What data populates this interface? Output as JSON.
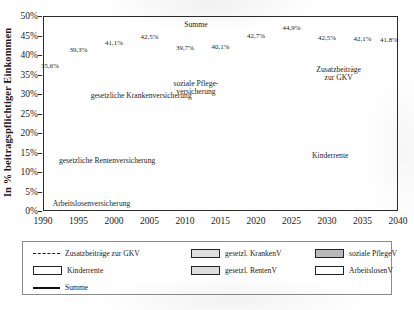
{
  "chart_data": {
    "type": "area",
    "title": "",
    "xlabel": "",
    "ylabel": "In % beitragspflichtiger Einkommen",
    "ylim": [
      0,
      50
    ],
    "xlim": [
      1990,
      2040
    ],
    "ytick_labels": [
      "0%",
      "5%",
      "10%",
      "15%",
      "20%",
      "25%",
      "30%",
      "35%",
      "40%",
      "45%",
      "50%"
    ],
    "ytick_values": [
      0,
      5,
      10,
      15,
      20,
      25,
      30,
      35,
      40,
      45,
      50
    ],
    "xtick_labels": [
      "1990",
      "1995",
      "2000",
      "2005",
      "2010",
      "2015",
      "2020",
      "2025",
      "2030",
      "2035",
      "2040"
    ],
    "xtick_values": [
      1990,
      1995,
      2000,
      2005,
      2010,
      2015,
      2020,
      2025,
      2030,
      2035,
      2040
    ],
    "grid": "horizontal",
    "legend_position": "bottom",
    "stacked": true,
    "x": [
      1990,
      1991,
      1992,
      1993,
      1994,
      1995,
      1996,
      1997,
      1998,
      1999,
      2000,
      2001,
      2002,
      2003,
      2004,
      2005,
      2006,
      2007,
      2008,
      2009,
      2010,
      2011,
      2012,
      2013,
      2014,
      2015,
      2016,
      2017,
      2018,
      2019,
      2020,
      2021,
      2022,
      2023,
      2024,
      2025,
      2026,
      2027,
      2028,
      2029,
      2030,
      2031,
      2032,
      2033,
      2034,
      2035,
      2036,
      2037,
      2038,
      2039,
      2040
    ],
    "series": [
      {
        "name": "ArbeitslosenV",
        "label": "Arbeitslosenversicherung",
        "color": "#ffffff",
        "values": [
          4.3,
          4.3,
          6.3,
          6.5,
          6.5,
          6.5,
          6.5,
          6.5,
          6.5,
          6.5,
          6.5,
          6.5,
          6.5,
          6.5,
          6.5,
          6.5,
          6.5,
          4.2,
          3.3,
          2.8,
          2.8,
          3.0,
          3.0,
          3.0,
          3.0,
          3.0,
          3.0,
          3.0,
          3.0,
          2.5,
          2.4,
          2.4,
          2.4,
          2.6,
          2.6,
          2.6,
          2.6,
          2.6,
          2.6,
          2.6,
          2.6,
          2.6,
          2.6,
          2.6,
          2.6,
          2.6,
          2.6,
          2.6,
          2.6,
          2.6,
          2.6
        ]
      },
      {
        "name": "gesetzl. RentenV",
        "label": "gesetzliche Rentenversicherung",
        "color": "#e3e3e3",
        "values": [
          18.7,
          17.7,
          17.7,
          17.5,
          19.2,
          18.6,
          19.2,
          20.3,
          20.3,
          19.5,
          19.3,
          19.1,
          19.1,
          19.5,
          19.5,
          19.5,
          19.5,
          19.9,
          19.9,
          19.9,
          19.9,
          19.6,
          19.6,
          18.9,
          18.9,
          18.7,
          18.7,
          18.7,
          18.6,
          18.6,
          18.6,
          18.6,
          18.6,
          18.6,
          18.6,
          18.8,
          19.1,
          19.4,
          19.8,
          20.1,
          20.4,
          20.6,
          20.8,
          21.0,
          21.2,
          21.4,
          21.5,
          21.7,
          21.8,
          21.9,
          22.0
        ]
      },
      {
        "name": "Kinderrente",
        "label": "Kinderrente",
        "color": "#ffffff",
        "values": [
          0.0,
          0.0,
          0.0,
          0.0,
          0.0,
          0.0,
          0.0,
          0.0,
          0.0,
          0.0,
          0.0,
          0.0,
          0.0,
          0.0,
          0.0,
          0.0,
          0.0,
          0.0,
          0.0,
          0.0,
          0.0,
          0.0,
          0.0,
          0.0,
          0.0,
          0.0,
          0.0,
          0.0,
          0.0,
          0.0,
          0.0,
          0.0,
          0.0,
          0.0,
          0.0,
          0.0,
          0.8,
          0.9,
          0.9,
          0.9,
          0.9,
          0.9,
          0.9,
          0.9,
          0.9,
          0.9,
          0.9,
          0.9,
          0.9,
          0.9,
          0.9
        ]
      },
      {
        "name": "soziale PflegeV",
        "label": "soziale Pflegeversicherung",
        "color": "#b9b9b9",
        "values": [
          0.0,
          0.0,
          0.0,
          0.0,
          0.0,
          1.0,
          1.7,
          1.7,
          1.7,
          1.7,
          1.7,
          1.7,
          1.7,
          1.7,
          1.7,
          1.7,
          1.7,
          1.7,
          1.8,
          1.95,
          1.95,
          1.95,
          1.95,
          2.05,
          2.05,
          2.35,
          2.35,
          2.55,
          2.55,
          3.05,
          3.05,
          3.05,
          3.05,
          3.4,
          3.4,
          3.5,
          3.6,
          3.7,
          3.8,
          3.9,
          4.0,
          4.1,
          4.2,
          4.3,
          4.4,
          4.5,
          4.6,
          4.7,
          4.8,
          4.9,
          5.0
        ]
      },
      {
        "name": "gesetzl. KrankenV",
        "label": "gesetzliche Krankenversicherung",
        "color": "#e8e8e8",
        "values": [
          12.6,
          13.2,
          12.7,
          13.4,
          13.2,
          13.2,
          13.6,
          13.5,
          13.5,
          13.5,
          13.6,
          13.6,
          14.0,
          14.3,
          14.2,
          13.7,
          13.3,
          13.9,
          14.0,
          14.9,
          14.9,
          15.5,
          15.5,
          15.5,
          15.5,
          15.5,
          15.7,
          15.8,
          15.9,
          16.2,
          16.3,
          16.4,
          16.5,
          16.6,
          16.7,
          16.9,
          16.2,
          15.7,
          15.4,
          15.1,
          14.9,
          14.7,
          14.5,
          14.4,
          14.3,
          14.2,
          14.1,
          14.0,
          13.9,
          13.8,
          13.7
        ]
      }
    ],
    "summe": {
      "name": "Summe",
      "label": "Summe",
      "color": "#111111",
      "values": [
        35.6,
        35.2,
        36.7,
        37.4,
        38.9,
        39.3,
        41.0,
        42.0,
        42.0,
        41.2,
        41.1,
        40.9,
        41.3,
        42.0,
        41.9,
        41.4,
        41.0,
        39.7,
        39.0,
        39.55,
        39.55,
        40.05,
        40.05,
        39.45,
        39.45,
        39.55,
        39.75,
        40.05,
        40.05,
        40.35,
        40.35,
        40.45,
        40.55,
        41.2,
        41.3,
        44.9,
        44.3,
        43.4,
        42.9,
        42.7,
        42.5,
        42.4,
        42.4,
        42.3,
        42.3,
        42.2,
        42.2,
        42.1,
        42.0,
        41.9,
        41.8
      ]
    },
    "zusatzbeitraege": {
      "name": "Zusatzbeiträge zur GKV",
      "label": "Zusatzbeiträge zur GKV",
      "color": "#1a1a1a",
      "style": "dashed",
      "values": [
        null,
        null,
        null,
        null,
        null,
        null,
        null,
        null,
        null,
        null,
        null,
        null,
        null,
        null,
        null,
        null,
        null,
        null,
        null,
        null,
        null,
        null,
        null,
        null,
        null,
        null,
        null,
        null,
        null,
        null,
        null,
        null,
        null,
        null,
        null,
        44.9,
        44.6,
        44.2,
        44.0,
        43.9,
        43.9,
        44.0,
        44.1,
        44.3,
        44.4,
        44.5,
        44.5,
        44.4,
        44.3,
        44.1,
        43.9
      ]
    },
    "point_labels": [
      {
        "x": 1990,
        "y": 35.6,
        "text": "35,6%"
      },
      {
        "x": 1995,
        "y": 39.3,
        "text": "39,3%"
      },
      {
        "x": 2000,
        "y": 41.1,
        "text": "41,1%"
      },
      {
        "x": 2005,
        "y": 42.5,
        "text": "42,5%"
      },
      {
        "x": 2010,
        "y": 39.7,
        "text": "39,7%"
      },
      {
        "x": 2015,
        "y": 40.1,
        "text": "40,1%"
      },
      {
        "x": 2020,
        "y": 42.7,
        "text": "42,7%"
      },
      {
        "x": 2025,
        "y": 44.9,
        "text": "44,9%"
      },
      {
        "x": 2030,
        "y": 42.5,
        "text": "42,5%"
      },
      {
        "x": 2035,
        "y": 42.1,
        "text": "42,1%"
      },
      {
        "x": 2040,
        "y": 41.8,
        "text": "41,8%"
      }
    ],
    "annotations": [
      {
        "name": "summe",
        "text": "Summe"
      },
      {
        "name": "gkv",
        "text": "gesetzliche Krankenversicherung"
      },
      {
        "name": "pflege",
        "text": "soziale Pflege-\nversicherung"
      },
      {
        "name": "zusatz",
        "text": "Zusatzbeiträge\nzur GKV"
      },
      {
        "name": "kinderrente",
        "text": "Kinderrente"
      },
      {
        "name": "rentenv",
        "text": "gesetzliche Rentenversicherung"
      },
      {
        "name": "alv",
        "text": "Arbeitslosenversicherung"
      }
    ]
  },
  "annotations": {
    "summe": "Summe",
    "gkv": "gesetzliche Krankenversicherung",
    "pflege_l1": "soziale Pflege-",
    "pflege_l2": "versicherung",
    "zusatz_l1": "Zusatzbeiträge",
    "zusatz_l2": "zur GKV",
    "kinderrente": "Kinderrente",
    "rentenv": "gesetzliche Rentenversicherung",
    "alv": "Arbeitslosenversicherung"
  },
  "legend": {
    "items": [
      {
        "label": "Zusatzbeiträge zur GKV",
        "swatch": "dash"
      },
      {
        "label": "gesetzl. KrankenV",
        "swatch": "lgray"
      },
      {
        "label": "soziale PflegeV",
        "swatch": "gray"
      },
      {
        "label": "Kinderrente",
        "swatch": "white"
      },
      {
        "label": "gesetzl. RentenV",
        "swatch": "lgray"
      },
      {
        "label": "ArbeitslosenV",
        "swatch": "white"
      },
      {
        "label": "Summe",
        "swatch": "line"
      }
    ]
  }
}
